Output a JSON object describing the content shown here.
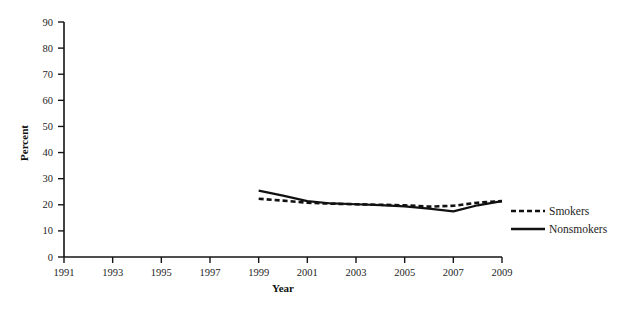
{
  "chart_data": {
    "type": "line",
    "title": "",
    "xlabel": "Year",
    "ylabel": "Percent",
    "xlim": [
      1991,
      2009
    ],
    "ylim": [
      0,
      90
    ],
    "ytick_step": 10,
    "xtick_step": 2,
    "grid": false,
    "legend_position": "right",
    "xticks": [
      1991,
      1993,
      1995,
      1997,
      1999,
      2001,
      2003,
      2005,
      2007,
      2009
    ],
    "yticks": [
      0,
      10,
      20,
      30,
      40,
      50,
      60,
      70,
      80,
      90
    ],
    "x": [
      1999,
      2000,
      2001,
      2002,
      2003,
      2004,
      2005,
      2006,
      2007,
      2008,
      2009
    ],
    "series": [
      {
        "name": "Smokers",
        "style": "dashed",
        "color": "#111111",
        "values": [
          22.3,
          21.6,
          20.8,
          20.4,
          20.2,
          20.0,
          19.8,
          19.3,
          19.6,
          20.8,
          21.4
        ]
      },
      {
        "name": "Nonsmokers",
        "style": "solid",
        "color": "#111111",
        "values": [
          25.4,
          23.5,
          21.4,
          20.5,
          20.2,
          19.9,
          19.4,
          18.5,
          17.5,
          19.8,
          21.4
        ]
      }
    ]
  },
  "axes": {
    "ylabel": "Percent",
    "xlabel": "Year",
    "ytick_labels": [
      "0",
      "10",
      "20",
      "30",
      "40",
      "50",
      "60",
      "70",
      "80",
      "90"
    ],
    "xtick_labels": [
      "1991",
      "1993",
      "1995",
      "1997",
      "1999",
      "2001",
      "2003",
      "2005",
      "2007",
      "2009"
    ]
  },
  "legend": {
    "items": [
      {
        "label": "Smokers",
        "style": "dashed"
      },
      {
        "label": "Nonsmokers",
        "style": "solid"
      }
    ]
  }
}
